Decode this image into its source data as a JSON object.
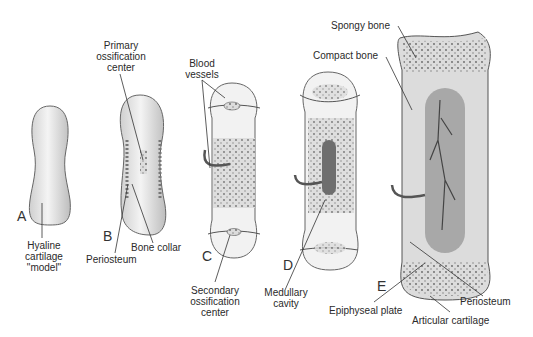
{
  "diagram": {
    "type": "endochondral ossification stages",
    "colors": {
      "bone_fill": "#e6e6e6",
      "cartilage": "#efefef",
      "outline": "#555555",
      "marrow": "#7a7a7a",
      "spongy": "#d4d4d4"
    },
    "stages": [
      {
        "letter": "A",
        "labels": [
          "Hyaline cartilage \"model\""
        ]
      },
      {
        "letter": "B",
        "labels": [
          "Primary ossification center",
          "Bone collar",
          "Periosteum"
        ]
      },
      {
        "letter": "C",
        "labels": [
          "Blood vessels",
          "Secondary ossification center"
        ]
      },
      {
        "letter": "D",
        "labels": [
          "Medullary cavity"
        ]
      },
      {
        "letter": "E",
        "labels": [
          "Spongy bone",
          "Compact bone",
          "Epiphyseal plate",
          "Articular cartilage",
          "Periosteum"
        ]
      }
    ]
  },
  "labels": {
    "a": "A",
    "b": "B",
    "c": "C",
    "d": "D",
    "e": "E",
    "hyaline_1": "Hyaline",
    "hyaline_2": "cartilage",
    "hyaline_3": "\"model\"",
    "primary_1": "Primary",
    "primary_2": "ossification",
    "primary_3": "center",
    "bone_collar": "Bone collar",
    "periosteum_b": "Periosteum",
    "blood_1": "Blood",
    "blood_2": "vessels",
    "secondary_1": "Secondary",
    "secondary_2": "ossification",
    "secondary_3": "center",
    "medullary_1": "Medullary",
    "medullary_2": "cavity",
    "spongy": "Spongy bone",
    "compact": "Compact bone",
    "epiphyseal": "Epiphyseal plate",
    "articular": "Articular cartilage",
    "periosteum_e": "Periosteum"
  }
}
